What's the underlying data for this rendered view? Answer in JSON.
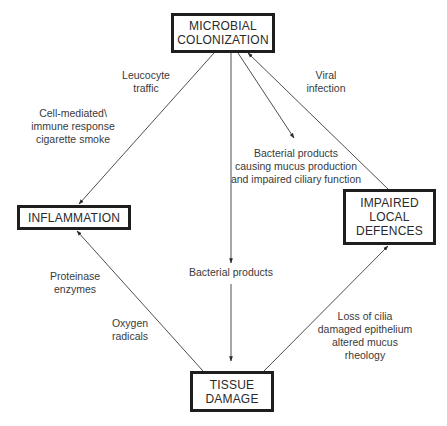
{
  "diagram": {
    "nodes": {
      "microbial_colonization": "MICROBIAL\nCOLONIZATION",
      "inflammation": "INFLAMMATION",
      "impaired_local_defences": "IMPAIRED\nLOCAL\nDEFENCES",
      "tissue_damage": "TISSUE\nDAMAGE"
    },
    "labels": {
      "leucocyte_traffic": "Leucocyte\ntraffic",
      "cell_mediated": "Cell-mediated\\\nimmune response\ncigarette smoke",
      "viral_infection": "Viral\ninfection",
      "bacterial_products_mucus": "Bacterial products\ncausing mucus production\nand impaired ciliary function",
      "bacterial_products": "Bacterial products",
      "proteinase_enzymes": "Proteinase\nenzymes",
      "oxygen_radicals": "Oxygen\nradicals",
      "loss_of_cilia": "Loss of cilia\ndamaged epithelium\naltered mucus\nrheology"
    },
    "edges": [
      {
        "from": "MICROBIAL COLONIZATION",
        "to": "INFLAMMATION",
        "label": "Leucocyte traffic / Cell-mediated immune response cigarette smoke"
      },
      {
        "from": "MICROBIAL COLONIZATION",
        "to": "TISSUE DAMAGE",
        "label": "Bacterial products"
      },
      {
        "from": "MICROBIAL COLONIZATION",
        "to": "IMPAIRED LOCAL DEFENCES",
        "label": "Bacterial products causing mucus production and impaired ciliary function"
      },
      {
        "from": "IMPAIRED LOCAL DEFENCES",
        "to": "MICROBIAL COLONIZATION",
        "label": "Viral infection"
      },
      {
        "from": "TISSUE DAMAGE",
        "to": "INFLAMMATION",
        "label": "Proteinase enzymes / Oxygen radicals"
      },
      {
        "from": "TISSUE DAMAGE",
        "to": "IMPAIRED LOCAL DEFENCES",
        "label": "Loss of cilia damaged epithelium altered mucus rheology"
      }
    ]
  }
}
